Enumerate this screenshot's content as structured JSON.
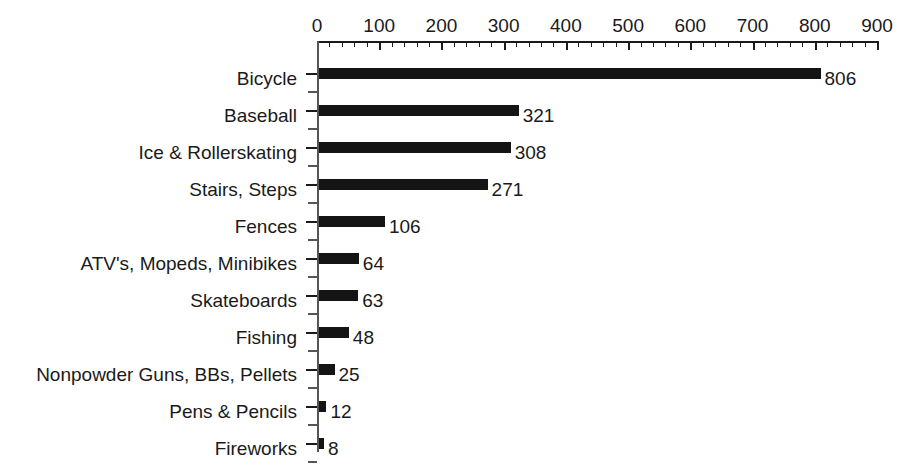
{
  "chart_data": {
    "type": "bar",
    "orientation": "horizontal",
    "title": "",
    "subtitle": "",
    "xlabel": "",
    "ylabel": "",
    "xlim": [
      0,
      900
    ],
    "ylim": null,
    "grid": false,
    "legend": null,
    "legend_position": "none",
    "bar_color": "#141414",
    "axis_color": "#1a1a1a",
    "background": "#ffffff",
    "x_major_tick_step": 100,
    "x_minor_tick_step": 20,
    "xticks": [
      0,
      100,
      200,
      300,
      400,
      500,
      600,
      700,
      800,
      900
    ],
    "xtick_labels": [
      "0",
      "100",
      "200",
      "300",
      "400",
      "500",
      "600",
      "700",
      "800",
      "900"
    ],
    "categories": [
      "Bicycle",
      "Baseball",
      "Ice & Rollerskating",
      "Stairs, Steps",
      "Fences",
      "ATV's, Mopeds, Minibikes",
      "Skateboards",
      "Fishing",
      "Nonpowder Guns, BBs, Pellets",
      "Pens & Pencils",
      "Fireworks"
    ],
    "values": [
      806,
      321,
      308,
      271,
      106,
      64,
      63,
      48,
      25,
      12,
      8
    ],
    "value_labels": [
      "806",
      "321",
      "308",
      "271",
      "106",
      "64",
      "63",
      "48",
      "25",
      "12",
      "8"
    ],
    "data_labels_shown": true
  }
}
